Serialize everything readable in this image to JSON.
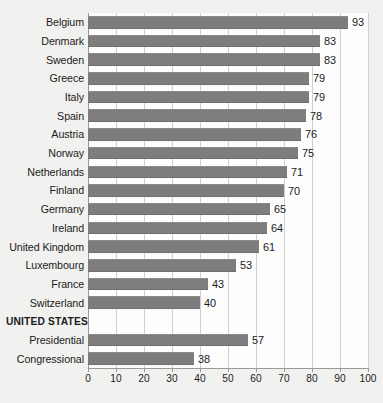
{
  "chart": {
    "type": "bar",
    "orientation": "horizontal",
    "title_remnant": "..."
  },
  "chart_data": {
    "type": "bar",
    "orientation": "horizontal",
    "title": "",
    "xlabel": "",
    "ylabel": "",
    "xlim": [
      0,
      100
    ],
    "xticks": [
      "0",
      "10",
      "20",
      "30",
      "40",
      "50",
      "60",
      "70",
      "80",
      "90",
      "100"
    ],
    "grid": "vertical",
    "legend": "none",
    "bar_color": "#7d7d7d",
    "categories": [
      "Belgium",
      "Denmark",
      "Sweden",
      "Greece",
      "Italy",
      "Spain",
      "Austria",
      "Norway",
      "Netherlands",
      "Finland",
      "Germany",
      "Ireland",
      "United Kingdom",
      "Luxembourg",
      "France",
      "Switzerland",
      "UNITED STATES",
      "Presidential",
      "Congressional"
    ],
    "values": [
      93,
      83,
      83,
      79,
      79,
      78,
      76,
      75,
      71,
      70,
      65,
      64,
      61,
      53,
      43,
      40,
      null,
      57,
      38
    ],
    "rows": [
      {
        "label": "Belgium",
        "value": 93,
        "value_text": "93",
        "group_header": false
      },
      {
        "label": "Denmark",
        "value": 83,
        "value_text": "83",
        "group_header": false
      },
      {
        "label": "Sweden",
        "value": 83,
        "value_text": "83",
        "group_header": false
      },
      {
        "label": "Greece",
        "value": 79,
        "value_text": "79",
        "group_header": false
      },
      {
        "label": "Italy",
        "value": 79,
        "value_text": "79",
        "group_header": false
      },
      {
        "label": "Spain",
        "value": 78,
        "value_text": "78",
        "group_header": false
      },
      {
        "label": "Austria",
        "value": 76,
        "value_text": "76",
        "group_header": false
      },
      {
        "label": "Norway",
        "value": 75,
        "value_text": "75",
        "group_header": false
      },
      {
        "label": "Netherlands",
        "value": 71,
        "value_text": "71",
        "group_header": false
      },
      {
        "label": "Finland",
        "value": 70,
        "value_text": "70",
        "group_header": false
      },
      {
        "label": "Germany",
        "value": 65,
        "value_text": "65",
        "group_header": false
      },
      {
        "label": "Ireland",
        "value": 64,
        "value_text": "64",
        "group_header": false
      },
      {
        "label": "United Kingdom",
        "value": 61,
        "value_text": "61",
        "group_header": false
      },
      {
        "label": "Luxembourg",
        "value": 53,
        "value_text": "53",
        "group_header": false
      },
      {
        "label": "France",
        "value": 43,
        "value_text": "43",
        "group_header": false
      },
      {
        "label": "Switzerland",
        "value": 40,
        "value_text": "40",
        "group_header": false
      },
      {
        "label": "UNITED STATES",
        "value": null,
        "value_text": "",
        "group_header": true
      },
      {
        "label": "Presidential",
        "value": 57,
        "value_text": "57",
        "group_header": false
      },
      {
        "label": "Congressional",
        "value": 38,
        "value_text": "38",
        "group_header": false
      }
    ]
  }
}
